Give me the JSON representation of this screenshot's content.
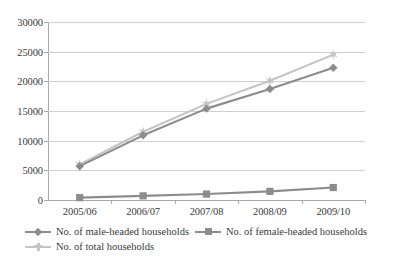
{
  "chart_data": {
    "type": "line",
    "title": "",
    "subtitle": "",
    "xlabel": "",
    "ylabel": "",
    "categories": [
      "2005/06",
      "2006/07",
      "2007/08",
      "2008/09",
      "2009/10"
    ],
    "ylim": [
      0,
      30000
    ],
    "yticks": [
      0,
      5000,
      10000,
      15000,
      20000,
      25000,
      30000
    ],
    "ytick_labels": [
      "0",
      "5000",
      "10000",
      "15000",
      "20000",
      "25000",
      "30000"
    ],
    "grid": true,
    "legend_position": "bottom",
    "series": [
      {
        "name": "No. of male-headed households",
        "values": [
          5700,
          10900,
          15400,
          18700,
          22300
        ],
        "color": "#8c8c8c",
        "marker": "diamond"
      },
      {
        "name": "No. of female-headed households",
        "values": [
          400,
          700,
          1000,
          1450,
          2100
        ],
        "color": "#8c8c8c",
        "marker": "square"
      },
      {
        "name": "No. of total households",
        "values": [
          6000,
          11500,
          16200,
          20100,
          24500
        ],
        "color": "#c4c4c4",
        "marker": "star"
      }
    ]
  },
  "colors": {
    "axis": "#a8a8a8",
    "grid": "#cfcfcf",
    "text": "#3a3a3a",
    "series_dark": "#8c8c8c",
    "series_light": "#c4c4c4",
    "background": "#ffffff"
  }
}
